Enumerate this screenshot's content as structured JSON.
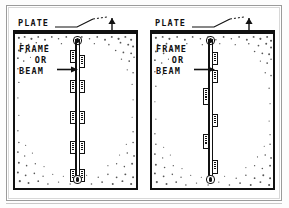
{
  "figure": {
    "ink_color": "#111111",
    "paper_color": "#ffffff",
    "border_color": "#9b9b9b"
  },
  "panels": [
    {
      "id": "left",
      "plate_label": "PLATE",
      "member_label_lines": [
        "FRAME",
        "OR",
        "BEAM"
      ],
      "member_description": "vertical frame or beam with paired attachment segments on both faces",
      "segment_layout": "paired",
      "segments": [
        {
          "side": "l",
          "top": 14,
          "height": 13,
          "ticks": 4
        },
        {
          "side": "r",
          "top": 19,
          "height": 13,
          "ticks": 4
        },
        {
          "side": "l",
          "top": 44,
          "height": 13,
          "ticks": 4
        },
        {
          "side": "r",
          "top": 44,
          "height": 13,
          "ticks": 4
        },
        {
          "side": "l",
          "top": 75,
          "height": 13,
          "ticks": 4
        },
        {
          "side": "r",
          "top": 75,
          "height": 13,
          "ticks": 4
        },
        {
          "side": "l",
          "top": 105,
          "height": 13,
          "ticks": 4
        },
        {
          "side": "r",
          "top": 105,
          "height": 13,
          "ticks": 4
        },
        {
          "side": "l",
          "top": 135,
          "height": 13,
          "ticks": 4
        },
        {
          "side": "r",
          "top": 135,
          "height": 13,
          "ticks": 4
        }
      ]
    },
    {
      "id": "right",
      "plate_label": "PLATE",
      "member_label_lines": [
        "FRAME",
        "OR",
        "BEAM"
      ],
      "member_description": "vertical frame or beam with staggered attachment segments alternating faces",
      "segment_layout": "staggered",
      "segments": [
        {
          "side": "r",
          "top": 16,
          "height": 13,
          "ticks": 4
        },
        {
          "side": "r",
          "top": 34,
          "height": 13,
          "ticks": 4
        },
        {
          "side": "l",
          "top": 52,
          "height": 17,
          "ticks": 6
        },
        {
          "side": "r",
          "top": 78,
          "height": 13,
          "ticks": 4
        },
        {
          "side": "l",
          "top": 98,
          "height": 15,
          "ticks": 5
        },
        {
          "side": "r",
          "top": 124,
          "height": 14,
          "ticks": 4
        }
      ]
    }
  ]
}
